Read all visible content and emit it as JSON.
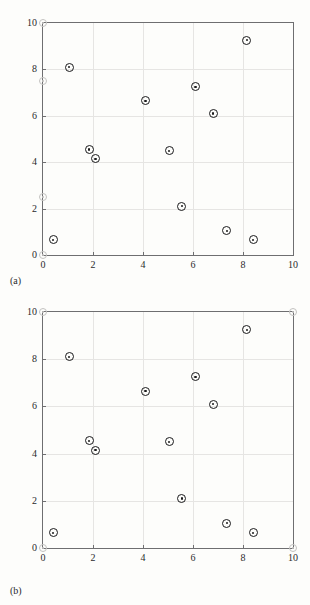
{
  "figure": {
    "background_color": "#fdfdfb",
    "axis_color": "#6e6e70",
    "grid_color": "#e6e5e3",
    "point_color": "#1b1b1d",
    "boundary_color": "#c3c2c0"
  },
  "panels": [
    {
      "label": "(a)",
      "name": "panel-a"
    },
    {
      "label": "(b)",
      "name": "panel-b"
    }
  ],
  "axis": {
    "xlim": [
      0,
      10
    ],
    "ylim": [
      0,
      10
    ],
    "xticks": [
      0,
      2,
      4,
      6,
      8,
      10
    ],
    "yticks": [
      0,
      2,
      4,
      6,
      8,
      10
    ],
    "xtick_labels": [
      "0",
      "2",
      "4",
      "6",
      "8",
      "10"
    ],
    "ytick_labels": [
      "0",
      "2",
      "4",
      "6",
      "8",
      "10"
    ],
    "grid": true
  },
  "chart_data": [
    {
      "type": "scatter",
      "title": "(a)",
      "xlabel": "",
      "ylabel": "",
      "xlim": [
        0,
        10
      ],
      "ylim": [
        0,
        10
      ],
      "grid": true,
      "legend": null,
      "series": [
        {
          "name": "data points",
          "marker": "circle-with-dot",
          "color": "#1b1b1d",
          "points": [
            [
              0.4,
              0.65
            ],
            [
              1.05,
              8.1
            ],
            [
              1.85,
              4.55
            ],
            [
              2.1,
              4.15
            ],
            [
              4.1,
              6.65
            ],
            [
              5.05,
              4.5
            ],
            [
              5.55,
              2.1
            ],
            [
              6.1,
              7.25
            ],
            [
              6.8,
              6.1
            ],
            [
              7.35,
              1.05
            ],
            [
              8.15,
              9.25
            ],
            [
              8.4,
              0.65
            ]
          ]
        },
        {
          "name": "boundary markers",
          "marker": "faint-circle",
          "color": "#c3c2c0",
          "points": [
            [
              0.0,
              10.0
            ],
            [
              0.0,
              7.5
            ],
            [
              0.0,
              2.5
            ],
            [
              0.0,
              0.0
            ]
          ]
        }
      ]
    },
    {
      "type": "scatter",
      "title": "(b)",
      "xlabel": "",
      "ylabel": "",
      "xlim": [
        0,
        10
      ],
      "ylim": [
        0,
        10
      ],
      "grid": true,
      "legend": null,
      "series": [
        {
          "name": "data points",
          "marker": "circle-with-dot",
          "color": "#1b1b1d",
          "points": [
            [
              0.4,
              0.65
            ],
            [
              1.05,
              8.1
            ],
            [
              1.85,
              4.55
            ],
            [
              2.1,
              4.15
            ],
            [
              4.1,
              6.65
            ],
            [
              5.05,
              4.5
            ],
            [
              5.55,
              2.1
            ],
            [
              6.1,
              7.25
            ],
            [
              6.8,
              6.1
            ],
            [
              7.35,
              1.05
            ],
            [
              8.15,
              9.25
            ],
            [
              8.4,
              0.65
            ]
          ]
        },
        {
          "name": "boundary markers",
          "marker": "faint-circle",
          "color": "#c3c2c0",
          "points": [
            [
              0.0,
              10.0
            ],
            [
              10.0,
              10.0
            ],
            [
              0.0,
              0.0
            ],
            [
              10.0,
              0.0
            ]
          ]
        }
      ]
    }
  ]
}
